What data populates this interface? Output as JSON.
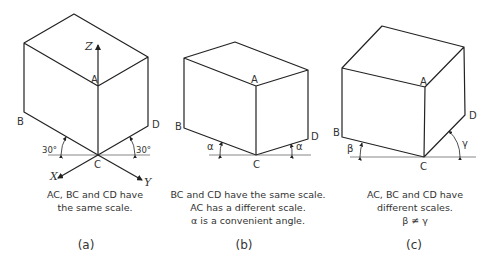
{
  "panels": [
    {
      "id": "a",
      "label": "(a)",
      "vertex_labels": {
        "A": "A",
        "B": "B",
        "C": "C",
        "D": "D"
      },
      "axis_labels": {
        "X": "X",
        "Y": "Y",
        "Z": "Z"
      },
      "angles": {
        "left": "30°",
        "right": "30°"
      },
      "caption": [
        "AC, BC and CD have",
        "the same scale."
      ]
    },
    {
      "id": "b",
      "label": "(b)",
      "vertex_labels": {
        "A": "A",
        "B": "B",
        "C": "C",
        "D": "D"
      },
      "angles": {
        "left": "α",
        "right": "α"
      },
      "caption": [
        "BC and CD have the same scale.",
        "AC has a different scale.",
        "α is a convenient angle."
      ]
    },
    {
      "id": "c",
      "label": "(c)",
      "vertex_labels": {
        "A": "A",
        "B": "B",
        "C": "C",
        "D": "D"
      },
      "angles": {
        "left": "β",
        "right": "γ"
      },
      "caption": [
        "AC, BC and CD have",
        "different scales.",
        "β ≠ γ"
      ]
    }
  ]
}
